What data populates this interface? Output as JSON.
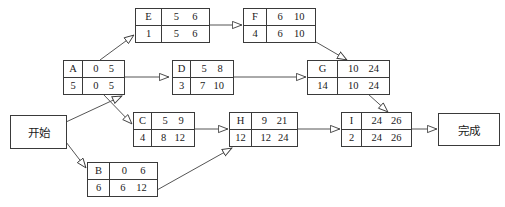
{
  "diagram": {
    "title": "",
    "type": "activity-on-node-network",
    "line_color": "#555555",
    "border_color": "#3a3a3a",
    "text_color": "#1a1a1a",
    "background": "#ffffff"
  },
  "terminals": {
    "start": {
      "label": "开始"
    },
    "finish": {
      "label": "完成"
    }
  },
  "nodes": [
    {
      "id": "A",
      "name": "A",
      "duration": "5",
      "early_start": "0",
      "early_finish": "5",
      "late_start": "0",
      "late_finish": "5"
    },
    {
      "id": "B",
      "name": "B",
      "duration": "6",
      "early_start": "0",
      "early_finish": "6",
      "late_start": "6",
      "late_finish": "12"
    },
    {
      "id": "C",
      "name": "C",
      "duration": "4",
      "early_start": "5",
      "early_finish": "9",
      "late_start": "8",
      "late_finish": "12"
    },
    {
      "id": "D",
      "name": "D",
      "duration": "3",
      "early_start": "5",
      "early_finish": "8",
      "late_start": "7",
      "late_finish": "10"
    },
    {
      "id": "E",
      "name": "E",
      "duration": "1",
      "early_start": "5",
      "early_finish": "6",
      "late_start": "5",
      "late_finish": "6"
    },
    {
      "id": "F",
      "name": "F",
      "duration": "4",
      "early_start": "6",
      "early_finish": "10",
      "late_start": "6",
      "late_finish": "10"
    },
    {
      "id": "G",
      "name": "G",
      "duration": "14",
      "early_start": "10",
      "early_finish": "24",
      "late_start": "10",
      "late_finish": "24"
    },
    {
      "id": "H",
      "name": "H",
      "duration": "12",
      "early_start": "9",
      "early_finish": "21",
      "late_start": "12",
      "late_finish": "24"
    },
    {
      "id": "I",
      "name": "I",
      "duration": "2",
      "early_start": "24",
      "early_finish": "26",
      "late_start": "24",
      "late_finish": "26"
    }
  ],
  "edges": [
    {
      "from": "start",
      "to": "A"
    },
    {
      "from": "start",
      "to": "B"
    },
    {
      "from": "A",
      "to": "E"
    },
    {
      "from": "A",
      "to": "D"
    },
    {
      "from": "A",
      "to": "C"
    },
    {
      "from": "E",
      "to": "F"
    },
    {
      "from": "F",
      "to": "G"
    },
    {
      "from": "D",
      "to": "G"
    },
    {
      "from": "C",
      "to": "H"
    },
    {
      "from": "B",
      "to": "H"
    },
    {
      "from": "H",
      "to": "I"
    },
    {
      "from": "G",
      "to": "I"
    },
    {
      "from": "I",
      "to": "finish"
    }
  ]
}
